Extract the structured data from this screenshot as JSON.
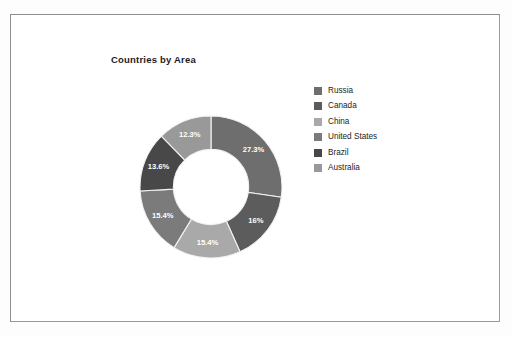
{
  "figure": {
    "frame_border_color": "#8d8d8d",
    "background": "#ffffff"
  },
  "chart_data": {
    "type": "pie",
    "variant": "donut",
    "title": "Countries by Area",
    "subtitle": "",
    "xlabel": "",
    "ylabel": "",
    "legend_position": "right",
    "grid": false,
    "start_angle_deg": 0,
    "direction": "clockwise",
    "inner_radius_ratio": 0.53,
    "categories": [
      "Russia",
      "Canada",
      "China",
      "United States",
      "Brazil",
      "Australia"
    ],
    "values": [
      27.3,
      16,
      15.4,
      15.4,
      13.6,
      12.3
    ],
    "value_labels": [
      "27.3%",
      "16%",
      "15.4%",
      "15.4%",
      "13.6%",
      "12.3%"
    ],
    "colors": [
      "#6e6e6e",
      "#5c5c5c",
      "#a9a9a9",
      "#7b7b7b",
      "#484848",
      "#999999"
    ],
    "slices": [
      {
        "label": "Russia",
        "value": 27.3,
        "value_label": "27.3%",
        "color": "#6e6e6e"
      },
      {
        "label": "Canada",
        "value": 16,
        "value_label": "16%",
        "color": "#5c5c5c"
      },
      {
        "label": "China",
        "value": 15.4,
        "value_label": "15.4%",
        "color": "#a9a9a9"
      },
      {
        "label": "United States",
        "value": 15.4,
        "value_label": "15.4%",
        "color": "#7b7b7b"
      },
      {
        "label": "Brazil",
        "value": 13.6,
        "value_label": "13.6%",
        "color": "#484848"
      },
      {
        "label": "Australia",
        "value": 12.3,
        "value_label": "12.3%",
        "color": "#999999"
      }
    ]
  },
  "legend": {
    "items": [
      {
        "label": "Russia",
        "color": "#6e6e6e"
      },
      {
        "label": "Canada",
        "color": "#5c5c5c"
      },
      {
        "label": "China",
        "color": "#a9a9a9"
      },
      {
        "label": "United States",
        "color": "#7b7b7b"
      },
      {
        "label": "Brazil",
        "color": "#484848"
      },
      {
        "label": "Australia",
        "color": "#999999"
      }
    ]
  }
}
